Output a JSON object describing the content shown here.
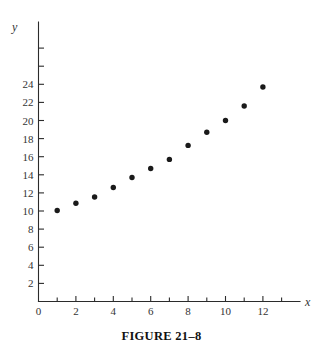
{
  "figure": {
    "caption": "FIGURE 21–8"
  },
  "chart_data": {
    "type": "scatter",
    "title": "",
    "xlabel": "x",
    "ylabel": "y",
    "xlim": [
      0,
      14
    ],
    "ylim": [
      0,
      26
    ],
    "grid": false,
    "legend": null,
    "x_major_ticks": [
      0,
      2,
      4,
      6,
      8,
      10,
      12
    ],
    "x_minor_ticks": [
      1,
      3,
      5,
      7,
      9,
      11,
      13
    ],
    "x_tick_labels": [
      "0",
      "2",
      "4",
      "6",
      "8",
      "10",
      "12"
    ],
    "y_major_ticks": [
      2,
      4,
      6,
      8,
      10,
      12,
      14,
      16,
      18,
      20,
      22,
      24
    ],
    "y_tick_labels": [
      "2",
      "4",
      "6",
      "8",
      "10",
      "12",
      "14",
      "16",
      "18",
      "20",
      "22",
      "24"
    ],
    "y_extra_ticks": [
      26,
      28
    ],
    "series": [
      {
        "name": "data",
        "marker": "circle",
        "color": "#1a1a1a",
        "points": [
          {
            "x": 1,
            "y": 10.05
          },
          {
            "x": 2,
            "y": 10.85
          },
          {
            "x": 3,
            "y": 11.55
          },
          {
            "x": 4,
            "y": 12.6
          },
          {
            "x": 5,
            "y": 13.7
          },
          {
            "x": 6,
            "y": 14.7
          },
          {
            "x": 7,
            "y": 15.7
          },
          {
            "x": 8,
            "y": 17.25
          },
          {
            "x": 9,
            "y": 18.7
          },
          {
            "x": 10,
            "y": 20.0
          },
          {
            "x": 11,
            "y": 21.6
          },
          {
            "x": 12,
            "y": 23.7
          }
        ]
      }
    ]
  }
}
